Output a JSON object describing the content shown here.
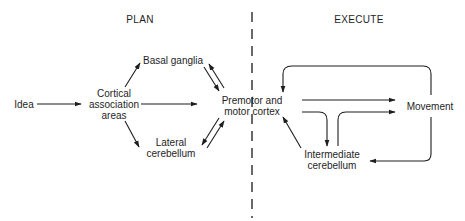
{
  "sections": {
    "plan": "PLAN",
    "execute": "EXECUTE"
  },
  "nodes": {
    "idea": "Idea",
    "cortical_association_areas": [
      "Cortical",
      "association",
      "areas"
    ],
    "basal_ganglia": "Basal ganglia",
    "lateral_cerebellum": [
      "Lateral",
      "cerebellum"
    ],
    "premotor_motor_cortex": [
      "Premotor and",
      "motor cortex"
    ],
    "movement": "Movement",
    "intermediate_cerebellum": [
      "Intermediate",
      "cerebellum"
    ]
  },
  "edges": [
    {
      "from": "Idea",
      "to": "Cortical association areas",
      "type": "one-way"
    },
    {
      "from": "Cortical association areas",
      "to": "Basal ganglia",
      "type": "one-way"
    },
    {
      "from": "Cortical association areas",
      "to": "Premotor and motor cortex",
      "type": "one-way"
    },
    {
      "from": "Cortical association areas",
      "to": "Lateral cerebellum",
      "type": "one-way"
    },
    {
      "from": "Basal ganglia",
      "to": "Premotor and motor cortex",
      "type": "two-way"
    },
    {
      "from": "Lateral cerebellum",
      "to": "Premotor and motor cortex",
      "type": "two-way"
    },
    {
      "from": "Premotor and motor cortex",
      "to": "Movement",
      "type": "one-way"
    },
    {
      "from": "Premotor and motor cortex",
      "to": "Intermediate cerebellum",
      "type": "one-way"
    },
    {
      "from": "Intermediate cerebellum",
      "to": "Movement",
      "type": "one-way"
    },
    {
      "from": "Intermediate cerebellum",
      "to": "Premotor and motor cortex",
      "type": "one-way"
    },
    {
      "from": "Movement",
      "to": "Premotor and motor cortex",
      "type": "feedback"
    },
    {
      "from": "Movement",
      "to": "Intermediate cerebellum",
      "type": "feedback"
    }
  ],
  "colors": {
    "ink": "#1e1e1e",
    "background": "#ffffff"
  }
}
